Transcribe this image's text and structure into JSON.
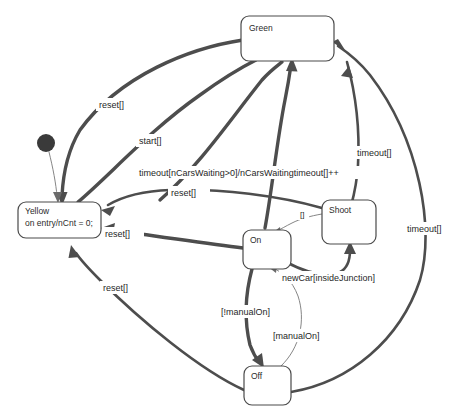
{
  "diagram": {
    "type": "state-machine-diagram",
    "canvas": {
      "width": 456,
      "height": 419,
      "background": "#ffffff"
    },
    "colors": {
      "edge": "#4d4d4d",
      "edge_thin": "#6b6b6b",
      "box_stroke": "#4a4a4a",
      "box_fill": "#ffffff",
      "text": "#1f1f1f",
      "init_dot": "#3a3a3a"
    },
    "states": [
      {
        "id": "initial",
        "kind": "initial-pseudostate",
        "label": "",
        "cx": 46,
        "cy": 143,
        "r": 9
      },
      {
        "id": "yellow",
        "kind": "state",
        "name": "Yellow",
        "body": "on entry/nCnt = 0;",
        "x": 18,
        "y": 202,
        "w": 83,
        "h": 36
      },
      {
        "id": "green",
        "kind": "state",
        "name": "Green",
        "body": "",
        "x": 241,
        "y": 16,
        "w": 93,
        "h": 45
      },
      {
        "id": "on",
        "kind": "state",
        "name": "On",
        "body": "",
        "x": 243,
        "y": 230,
        "w": 48,
        "h": 39
      },
      {
        "id": "shoot",
        "kind": "state",
        "name": "Shoot",
        "body": "",
        "x": 322,
        "y": 200,
        "w": 54,
        "h": 44
      },
      {
        "id": "off",
        "kind": "state",
        "name": "Off",
        "body": "",
        "x": 244,
        "y": 366,
        "w": 47,
        "h": 39
      }
    ],
    "transitions": [
      {
        "id": "t-init-yellow",
        "from": "initial",
        "to": "yellow",
        "label": "",
        "weight": "hair"
      },
      {
        "id": "t-green-yellow-reset",
        "from": "green",
        "to": "yellow",
        "label": "reset[]",
        "label_x": 100,
        "label_y": 108,
        "weight": "thick"
      },
      {
        "id": "t-yellow-green-start",
        "from": "yellow",
        "to": "green",
        "label": "start[]",
        "label_x": 140,
        "label_y": 144,
        "weight": "thick"
      },
      {
        "id": "t-yellow-green-timeout",
        "from": "yellow",
        "to": "green",
        "label": "timeout[nCarsWaiting>0]/nCarsWaitingtimeout[]++",
        "label_x": 140,
        "label_y": 176,
        "weight": "thick"
      },
      {
        "id": "t-shoot-yellow-reset",
        "from": "shoot",
        "to": "yellow",
        "label": "reset[]",
        "label_x": 172,
        "label_y": 196,
        "weight": "medium"
      },
      {
        "id": "t-on-yellow-reset",
        "from": "on",
        "to": "yellow",
        "label": "reset[]",
        "label_x": 106,
        "label_y": 237,
        "weight": "thick"
      },
      {
        "id": "t-off-yellow-reset",
        "from": "off",
        "to": "yellow",
        "label": "reset[]",
        "label_x": 104,
        "label_y": 291,
        "weight": "medium"
      },
      {
        "id": "t-green-shoot-timeout",
        "from": "green",
        "to": "shoot",
        "label": "timeout[]",
        "label_x": 358,
        "label_y": 156,
        "weight": "medium"
      },
      {
        "id": "t-off-green-timeout",
        "from": "off",
        "to": "green",
        "label": "timeout[]",
        "label_x": 408,
        "label_y": 232,
        "weight": "medium"
      },
      {
        "id": "t-shoot-on",
        "from": "shoot",
        "to": "on",
        "label": "[]",
        "label_x": 301,
        "label_y": 216,
        "weight": "hair"
      },
      {
        "id": "t-on-shoot-newcar",
        "from": "on",
        "to": "shoot",
        "label": "newCar[insideJunction]",
        "label_x": 283,
        "label_y": 281,
        "weight": "medium"
      },
      {
        "id": "t-on-off",
        "from": "on",
        "to": "off",
        "label": "[!manualOn]",
        "label_x": 222,
        "label_y": 315,
        "weight": "thick"
      },
      {
        "id": "t-off-on",
        "from": "off",
        "to": "on",
        "label": "[manualOn]",
        "label_x": 274,
        "label_y": 339,
        "weight": "hair"
      },
      {
        "id": "t-on-green",
        "from": "on",
        "to": "green",
        "label": "",
        "weight": "thick"
      }
    ]
  }
}
